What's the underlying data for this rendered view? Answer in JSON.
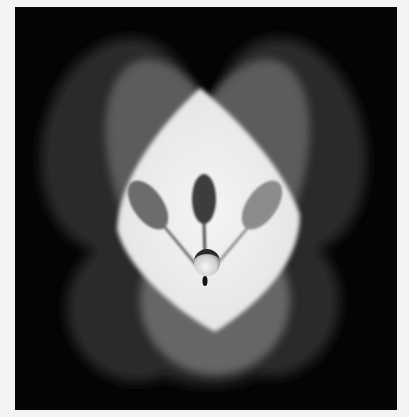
{
  "image": {
    "description": "Grayscale photograph of overlapping soft light lobes forming a bright central diamond shape, with three spoon-like paddle silhouettes on thin stems converging to a small sphere",
    "frame_background": "#f3f3f3",
    "panel_background": "#050505",
    "elements": {
      "outer_lobes": {
        "count": 4,
        "color": "#2a2a2a"
      },
      "middle_lobes": {
        "count": 2,
        "color": "#5e5e5e"
      },
      "center_diamond": {
        "color": "#ececec"
      },
      "paddles": [
        {
          "position": "left",
          "color": "#6a6a6a"
        },
        {
          "position": "center",
          "color": "#3a3a3a"
        },
        {
          "position": "right",
          "color": "#8a8a8a"
        }
      ],
      "sphere": {
        "color": "#d8d8d8"
      }
    }
  }
}
